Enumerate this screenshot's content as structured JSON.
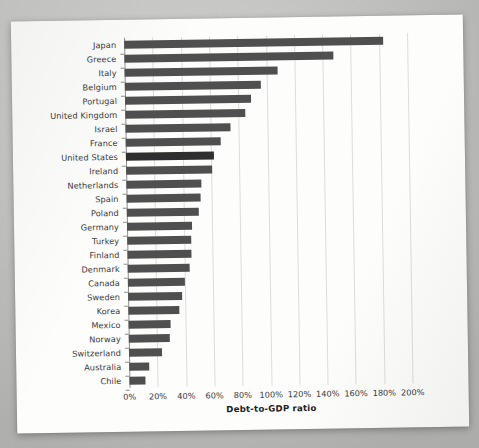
{
  "chart_data": {
    "type": "bar",
    "orientation": "horizontal",
    "title": "",
    "xlabel": "Debt-to-GDP ratio",
    "ylabel": "",
    "xlim": [
      0,
      200
    ],
    "xunit": "%",
    "grid": true,
    "legend": null,
    "xticks": [
      "0%",
      "20%",
      "40%",
      "60%",
      "80%",
      "100%",
      "120%",
      "140%",
      "160%",
      "180%",
      "200%"
    ],
    "xtick_values": [
      0,
      20,
      40,
      60,
      80,
      100,
      120,
      140,
      160,
      180,
      200
    ],
    "categories": [
      "Japan",
      "Greece",
      "Italy",
      "Belgium",
      "Portugal",
      "United Kingdom",
      "Israel",
      "France",
      "United States",
      "Ireland",
      "Netherlands",
      "Spain",
      "Poland",
      "Germany",
      "Turkey",
      "Finland",
      "Denmark",
      "Canada",
      "Sweden",
      "Korea",
      "Mexico",
      "Norway",
      "Switzerland",
      "Australia",
      "Chile"
    ],
    "values": [
      183,
      148,
      108,
      96,
      89,
      85,
      74,
      67,
      62,
      61,
      53,
      52,
      51,
      46,
      45,
      45,
      44,
      40,
      38,
      36,
      30,
      29,
      23,
      14,
      11
    ],
    "highlight_category": "United States",
    "colors": {
      "bar": "#4f4f4f",
      "bar_highlight": "#2f2f2f",
      "grid": "#dcdcda",
      "axis": "#8e8e8c",
      "text": "#3a3a3a",
      "page": "#fdfdfc",
      "background": "#c9c9c7"
    }
  }
}
